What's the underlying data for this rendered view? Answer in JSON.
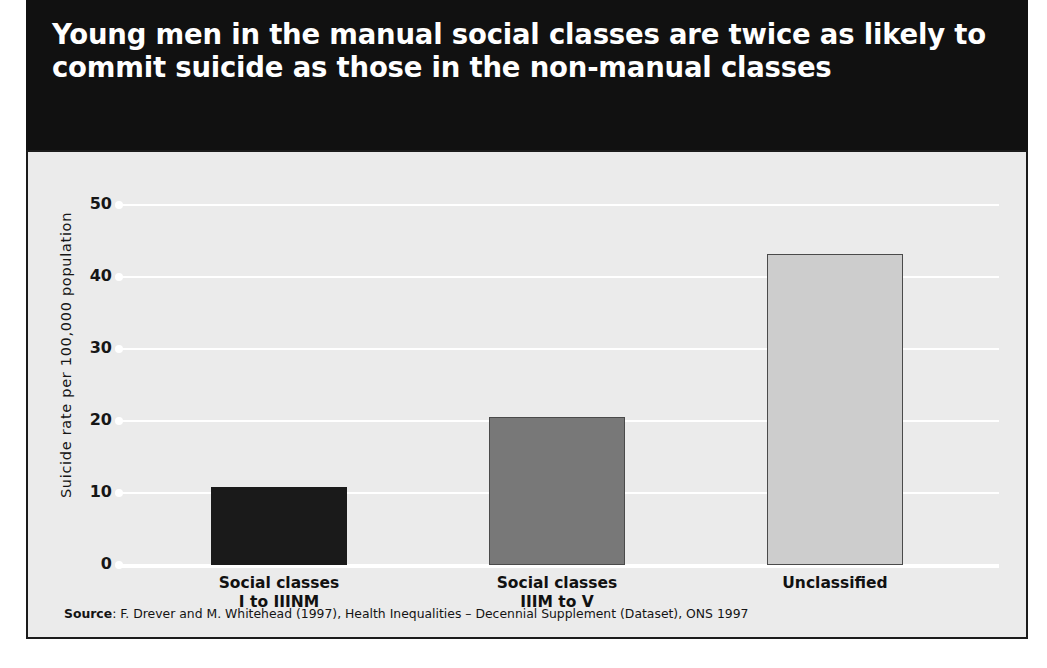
{
  "title": "Young men in the manual social classes are twice as likely to commit suicide as those in the non-manual classes",
  "source": {
    "label": "Source",
    "text": ": F. Drever and M. Whitehead (1997), Health Inequalities – Decennial Supplement (Dataset), ONS 1997"
  },
  "colors": {
    "banner_background": "#111111",
    "banner_text": "#ffffff",
    "plot_background": "#ebebeb",
    "gridline": "#ffffff",
    "frame_border": "#1b1b1b",
    "bar_1": "#1a1a1a",
    "bar_2": "#787878",
    "bar_3": "#cdcdcd",
    "bar_outline": "#4a4a4a"
  },
  "chart_data": {
    "type": "bar",
    "title": "Young men in the manual social classes are twice as likely to commit suicide as those in the non-manual classes",
    "xlabel": "",
    "ylabel": "Suicide rate per 100,000 population",
    "ylim": [
      0,
      50
    ],
    "yticks": [
      0,
      10,
      20,
      30,
      40,
      50
    ],
    "ytick_labels": [
      "0",
      "10",
      "20",
      "30",
      "40",
      "50"
    ],
    "grid": true,
    "legend": "none",
    "categories": [
      "Social classes\nI to IIINM",
      "Social classes\nIIIM to V",
      "Unclassified"
    ],
    "category_lines": [
      [
        "Social classes",
        "I to IIINM"
      ],
      [
        "Social classes",
        "IIIM to V"
      ],
      [
        "Unclassified",
        ""
      ]
    ],
    "values": [
      10.8,
      20.6,
      43.2
    ],
    "bar_colors": [
      "#1a1a1a",
      "#787878",
      "#cdcdcd"
    ]
  }
}
